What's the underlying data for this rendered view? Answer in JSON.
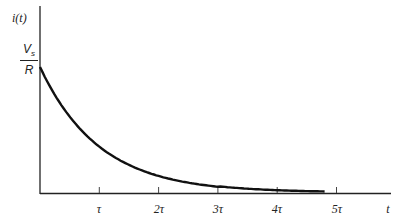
{
  "chart_data": {
    "type": "line",
    "title": "",
    "xlabel": "t",
    "ylabel": "i(t)",
    "y_start_label": {
      "numerator": "V",
      "numerator_sub": "s",
      "denominator": "R"
    },
    "x_ticks": [
      "τ",
      "2τ",
      "3τ",
      "4τ",
      "5τ"
    ],
    "x_tick_values": [
      1,
      2,
      3,
      4,
      5
    ],
    "series": [
      {
        "name": "i(t) = (Vs/R) e^(-t/τ)",
        "x": [
          0,
          0.5,
          1,
          1.5,
          2,
          2.5,
          3,
          3.5,
          4,
          4.5,
          4.8
        ],
        "values": [
          1.0,
          0.607,
          0.368,
          0.223,
          0.135,
          0.082,
          0.05,
          0.03,
          0.018,
          0.011,
          0.008
        ]
      }
    ],
    "xlim": [
      0,
      5.9
    ],
    "ylim": [
      0,
      1.3
    ],
    "grid": false,
    "legend": "none"
  },
  "labels": {
    "y_axis": "i(t)",
    "x_axis": "t",
    "vs": "V",
    "vs_sub": "s",
    "r": "R",
    "ticks": [
      "τ",
      "2τ",
      "3τ",
      "4τ",
      "5τ"
    ]
  }
}
